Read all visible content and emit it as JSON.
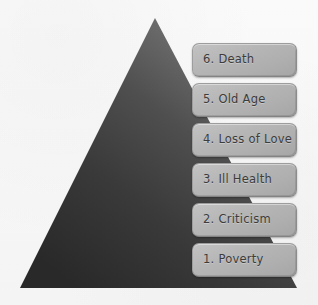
{
  "figure": {
    "type": "pyramid-diagram",
    "background_color": "#f8f8f8",
    "title": ""
  },
  "pyramid": {
    "name": "six-basic-fears-pyramid",
    "apex": {
      "x": 155,
      "y": 18
    },
    "base_left": {
      "x": 20,
      "y": 288
    },
    "base_right": {
      "x": 297,
      "y": 288
    },
    "gradient_light_color": "#8a8a8a",
    "gradient_dark_color": "#2b2b2b"
  },
  "levels": [
    {
      "number": "6.",
      "title": "Death",
      "label": "6. Death",
      "top": 43
    },
    {
      "number": "5.",
      "title": "Old Age",
      "label": "5. Old Age",
      "top": 83
    },
    {
      "number": "4.",
      "title": "Loss of Love",
      "label": "4. Loss of Love",
      "top": 123
    },
    {
      "number": "3.",
      "title": "Ill Health",
      "label": "3. Ill Health",
      "top": 163
    },
    {
      "number": "2.",
      "title": "Criticism",
      "label": "2. Criticism",
      "top": 203
    },
    {
      "number": "1.",
      "title": "Poverty",
      "label": "1. Poverty",
      "top": 243
    }
  ],
  "style": {
    "box_fill_color": "#b5b5b5",
    "box_border_color": "#9d9d9d",
    "text_color": "#3c3c3c"
  }
}
